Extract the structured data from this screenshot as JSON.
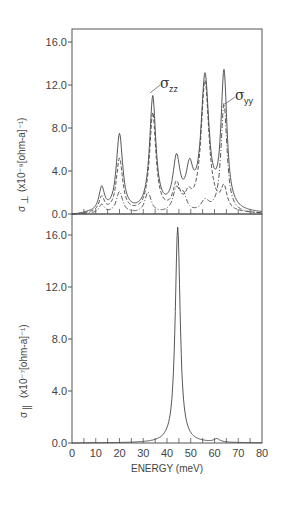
{
  "chart_data": [
    {
      "type": "line",
      "panel": "top",
      "title": "",
      "xlabel": "ENERGY (meV)",
      "ylabel": "σ⊥ (x10⁻⁹[ohm-a]⁻¹)",
      "xlim": [
        0,
        80
      ],
      "ylim": [
        0,
        16.9
      ],
      "yticks": [
        "0.0",
        "4.0",
        "8.0",
        "12.0",
        "16.0"
      ],
      "ytick_values": [
        0,
        4,
        8,
        12,
        16
      ],
      "xticks_minor_step": 5,
      "grid": false,
      "annotations": [
        {
          "text": "σ",
          "sub": "zz",
          "x": 38,
          "y": 10.4
        },
        {
          "text": "σ",
          "sub": "yy",
          "x": 68,
          "y": 10.2
        }
      ],
      "series": [
        {
          "name": "σ⊥ (total)",
          "style": "solid",
          "peaks": [
            [
              12.5,
              2.2,
              1.4
            ],
            [
              20,
              7.2,
              1.6
            ],
            [
              34,
              10.6,
              1.6
            ],
            [
              44,
              4.6,
              1.8
            ],
            [
              49.5,
              3.4,
              1.8
            ],
            [
              56,
              12.3,
              2.0
            ],
            [
              64,
              12.6,
              1.5
            ]
          ],
          "peak_values": {
            "13": 3.8,
            "20": 9.0,
            "34": 12.7,
            "44": 8.0,
            "56": 15.6,
            "64": 15.0
          }
        },
        {
          "name": "σzz",
          "style": "dashed",
          "peaks": [
            [
              12.5,
              1.4,
              1.4
            ],
            [
              20,
              5.0,
              1.6
            ],
            [
              34,
              9.2,
              1.6
            ],
            [
              44,
              2.4,
              1.8
            ],
            [
              49,
              1.2,
              1.6
            ],
            [
              56,
              12.2,
              2.0
            ],
            [
              64,
              2.0,
              1.5
            ]
          ],
          "peak_values": {
            "13": 2.5,
            "20": 6.3,
            "34": 10.6,
            "44": 4.4,
            "56": 14.2,
            "64": 10.2
          }
        },
        {
          "name": "σyy",
          "style": "dash-dot",
          "peaks": [
            [
              12.5,
              0.8,
              1.4
            ],
            [
              20,
              2.0,
              1.6
            ],
            [
              32,
              1.9,
              1.6
            ],
            [
              44,
              2.2,
              1.8
            ],
            [
              47,
              1.4,
              1.5
            ],
            [
              56,
              1.0,
              2.0
            ],
            [
              64,
              10.2,
              1.5
            ]
          ],
          "peak_values": {
            "13": 1.2,
            "20": 2.8,
            "32": 2.8,
            "44": 3.8,
            "64": 10.2
          }
        }
      ]
    },
    {
      "type": "line",
      "panel": "bottom",
      "title": "",
      "xlabel": "ENERGY (meV)",
      "ylabel": "σ∥ (x10⁻⁷[ohm-a]⁻¹)",
      "xlim": [
        0,
        80
      ],
      "ylim": [
        0,
        17.2
      ],
      "xticks": [
        "0",
        "10",
        "20",
        "30",
        "40",
        "50",
        "60",
        "70",
        "80"
      ],
      "xtick_values": [
        0,
        10,
        20,
        30,
        40,
        50,
        60,
        70,
        80
      ],
      "yticks": [
        "0.0",
        "4.0",
        "8.0",
        "12.0",
        "16.0"
      ],
      "ytick_values": [
        0,
        4,
        8,
        12,
        16
      ],
      "grid": false,
      "series": [
        {
          "name": "σ∥",
          "style": "solid",
          "peaks": [
            [
              44.5,
              16.6,
              1.25
            ],
            [
              61,
              0.25,
              1.5
            ]
          ],
          "peak_values": {
            "44.5": 16.8,
            "61": 0.9
          }
        }
      ]
    }
  ],
  "labels": {
    "top_ylabel_sym": "σ",
    "top_ylabel_sub": "⊥",
    "top_ylabel_unit": "(x10⁻⁹[ohm-a]⁻¹)",
    "bottom_ylabel_sym": "σ",
    "bottom_ylabel_sub": "∥",
    "bottom_ylabel_unit": "(x10⁻⁷[ohm-a]⁻¹)",
    "xlabel": "ENERGY (meV)",
    "zz_sym": "σ",
    "zz_sub": "zz",
    "yy_sym": "σ",
    "yy_sub": "yy"
  }
}
